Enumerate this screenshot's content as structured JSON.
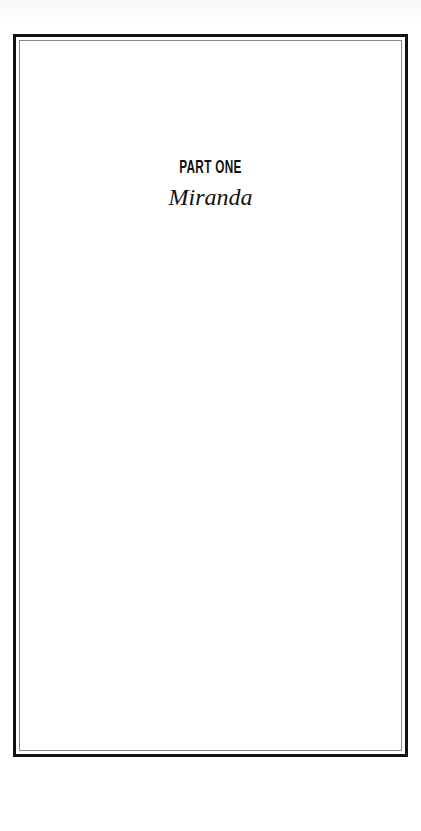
{
  "page": {
    "part_label": "PART ONE",
    "part_title": "Miranda"
  },
  "colors": {
    "frame_outer": "#111111",
    "frame_inner": "#888888",
    "text": "#111111",
    "background": "#ffffff"
  }
}
